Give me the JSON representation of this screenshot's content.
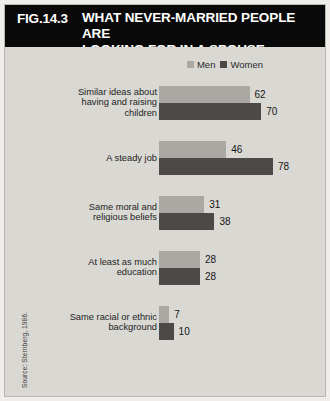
{
  "figure": {
    "number": "FIG.14.3",
    "title": "WHAT NEVER-MARRIED PEOPLE ARE\nLOOKING FOR IN A SPOUSE",
    "source": "Source: Sternberg, 1986."
  },
  "legend": {
    "men_label": "Men",
    "women_label": "Women"
  },
  "colors": {
    "men": "#a9a8a3",
    "women": "#4b4a48",
    "header_background": "#090909",
    "header_text": "#ffffff",
    "plot_background": "#d9d8d3"
  },
  "chart_data": {
    "type": "bar",
    "orientation": "horizontal",
    "title": "WHAT NEVER-MARRIED PEOPLE ARE LOOKING FOR IN A SPOUSE",
    "subtitle": "",
    "xlabel": "",
    "ylabel": "",
    "xlim": [
      0,
      80
    ],
    "grid": false,
    "legend_position": "top-right",
    "categories": [
      "Similar ideas about\nhaving and raising\nchildren",
      "A steady job",
      "Same moral and\nreligious beliefs",
      "At least as much\neducation",
      "Same racial or ethnic\nbackground"
    ],
    "series": [
      {
        "name": "Men",
        "values": [
          62,
          46,
          31,
          28,
          7
        ]
      },
      {
        "name": "Women",
        "values": [
          70,
          78,
          38,
          28,
          10
        ]
      }
    ]
  },
  "groups": [
    {
      "label": "Similar ideas about\nhaving and raising\nchildren",
      "men": 62,
      "women": 70,
      "men_value": "62",
      "women_value": "70"
    },
    {
      "label": "A steady job",
      "men": 46,
      "women": 78,
      "men_value": "46",
      "women_value": "78"
    },
    {
      "label": "Same moral and\nreligious beliefs",
      "men": 31,
      "women": 38,
      "men_value": "31",
      "women_value": "38"
    },
    {
      "label": "At least as much\neducation",
      "men": 28,
      "women": 28,
      "men_value": "28",
      "women_value": "28"
    },
    {
      "label": "Same racial or ethnic\nbackground",
      "men": 7,
      "women": 10,
      "men_value": "7",
      "women_value": "10"
    }
  ]
}
